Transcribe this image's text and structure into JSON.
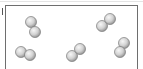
{
  "diagram": {
    "container": {
      "left": 5,
      "top": 5,
      "right": 138
    },
    "atom_radius": 5.5,
    "atom_colors": {
      "highlight": "#f4f4f4",
      "mid": "#cfcfcf",
      "shadow": "#8f8f8f",
      "outline": "#7a7a7a"
    },
    "molecules": [
      {
        "id": "m1",
        "atoms": [
          [
            31,
            22
          ],
          [
            35,
            32
          ]
        ]
      },
      {
        "id": "m2",
        "atoms": [
          [
            102,
            26
          ],
          [
            110,
            19
          ]
        ]
      },
      {
        "id": "m3",
        "atoms": [
          [
            21,
            52
          ],
          [
            30,
            55
          ]
        ]
      },
      {
        "id": "m4",
        "atoms": [
          [
            72,
            56
          ],
          [
            80,
            49
          ]
        ]
      },
      {
        "id": "m5",
        "atoms": [
          [
            124,
            43
          ],
          [
            120,
            52
          ]
        ]
      }
    ]
  }
}
